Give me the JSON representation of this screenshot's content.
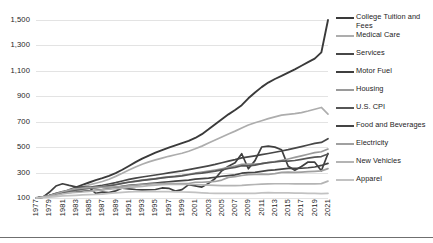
{
  "chart_data": {
    "type": "line",
    "title": "",
    "subtitle": "",
    "xlabel": "",
    "ylabel": "",
    "index_base": "Index (1977 = 100)",
    "grid": true,
    "legend_position": "right",
    "xlim": [
      1977,
      2021
    ],
    "ylim": [
      100,
      1500
    ],
    "yticks": [
      100,
      300,
      500,
      700,
      900,
      1100,
      1300,
      1500
    ],
    "ytick_labels": [
      "100",
      "300",
      "500",
      "700",
      "900",
      "1,100",
      "1,300",
      "1,500"
    ],
    "x": [
      1977,
      1978,
      1979,
      1980,
      1981,
      1982,
      1983,
      1984,
      1985,
      1986,
      1987,
      1988,
      1989,
      1990,
      1991,
      1992,
      1993,
      1994,
      1995,
      1996,
      1997,
      1998,
      1999,
      2000,
      2001,
      2002,
      2003,
      2004,
      2005,
      2006,
      2007,
      2008,
      2009,
      2010,
      2011,
      2012,
      2013,
      2014,
      2015,
      2016,
      2017,
      2018,
      2019,
      2020,
      2021
    ],
    "xtick_labels": [
      "1977",
      "1979",
      "1981",
      "1983",
      "1985",
      "1987",
      "1989",
      "1991",
      "1993",
      "1995",
      "1997",
      "1999",
      "2001",
      "2003",
      "2005",
      "2007",
      "2009",
      "2011",
      "2013",
      "2015",
      "2017",
      "2019",
      "2021"
    ],
    "series": [
      {
        "name": "College Tuition and Fees",
        "color": "#3a3a3a",
        "width": 1.9,
        "values": [
          100,
          108,
          117,
          128,
          144,
          164,
          184,
          203,
          222,
          240,
          256,
          274,
          296,
          322,
          352,
          382,
          410,
          434,
          456,
          477,
          496,
          514,
          531,
          549,
          572,
          602,
          640,
          680,
          720,
          758,
          792,
          830,
          884,
          930,
          972,
          1008,
          1036,
          1060,
          1086,
          1112,
          1140,
          1168,
          1196,
          1245,
          1525
        ]
      },
      {
        "name": "Medical Care",
        "color": "#adadad",
        "width": 1.7,
        "values": [
          100,
          108,
          118,
          130,
          145,
          162,
          177,
          190,
          203,
          216,
          230,
          248,
          270,
          294,
          320,
          344,
          366,
          384,
          400,
          414,
          428,
          440,
          452,
          468,
          487,
          508,
          532,
          556,
          580,
          604,
          626,
          650,
          674,
          692,
          708,
          724,
          738,
          752,
          758,
          764,
          772,
          784,
          798,
          812,
          760
        ]
      },
      {
        "name": "Services",
        "color": "#474747",
        "width": 1.7,
        "values": [
          100,
          108,
          118,
          131,
          146,
          158,
          167,
          175,
          184,
          192,
          200,
          210,
          221,
          234,
          246,
          256,
          265,
          273,
          281,
          289,
          297,
          305,
          313,
          323,
          333,
          343,
          353,
          364,
          377,
          390,
          402,
          416,
          424,
          432,
          441,
          450,
          460,
          470,
          480,
          492,
          504,
          517,
          530,
          537,
          566
        ]
      },
      {
        "name": "Motor Fuel",
        "color": "#3f3f3f",
        "width": 1.7,
        "values": [
          100,
          105,
          145,
          194,
          212,
          199,
          188,
          185,
          183,
          136,
          146,
          142,
          156,
          178,
          172,
          167,
          164,
          165,
          167,
          179,
          176,
          154,
          166,
          205,
          196,
          186,
          215,
          253,
          314,
          350,
          377,
          448,
          330,
          394,
          501,
          508,
          500,
          480,
          350,
          318,
          348,
          383,
          382,
          314,
          450
        ]
      },
      {
        "name": "Housing",
        "color": "#9a9a9a",
        "width": 1.7,
        "values": [
          100,
          108,
          119,
          133,
          147,
          156,
          162,
          169,
          176,
          182,
          189,
          197,
          206,
          216,
          226,
          233,
          240,
          246,
          253,
          260,
          266,
          273,
          279,
          287,
          296,
          303,
          311,
          320,
          330,
          341,
          352,
          364,
          367,
          366,
          371,
          379,
          387,
          396,
          407,
          419,
          431,
          444,
          457,
          464,
          485
        ]
      },
      {
        "name": "U.S. CPI",
        "color": "#565656",
        "width": 1.7,
        "values": [
          100,
          108,
          120,
          136,
          150,
          159,
          164,
          171,
          177,
          181,
          187,
          195,
          204,
          215,
          224,
          231,
          238,
          244,
          251,
          258,
          264,
          268,
          274,
          283,
          291,
          296,
          303,
          311,
          321,
          332,
          341,
          354,
          353,
          359,
          370,
          378,
          383,
          390,
          390,
          395,
          404,
          413,
          421,
          426,
          446
        ]
      },
      {
        "name": "Food and Beverages",
        "color": "#444444",
        "width": 1.7,
        "values": [
          100,
          108,
          119,
          131,
          140,
          145,
          148,
          153,
          157,
          161,
          166,
          173,
          181,
          191,
          199,
          203,
          208,
          213,
          218,
          223,
          228,
          232,
          236,
          241,
          248,
          252,
          256,
          263,
          271,
          276,
          282,
          295,
          300,
          301,
          310,
          317,
          321,
          327,
          333,
          333,
          334,
          338,
          344,
          356,
          372
        ]
      },
      {
        "name": "Electricity",
        "color": "#a0a0a0",
        "width": 1.7,
        "values": [
          100,
          110,
          119,
          133,
          149,
          162,
          171,
          178,
          182,
          183,
          183,
          185,
          188,
          191,
          196,
          201,
          206,
          210,
          212,
          214,
          215,
          214,
          213,
          214,
          224,
          224,
          227,
          230,
          241,
          262,
          268,
          277,
          284,
          285,
          288,
          286,
          292,
          301,
          304,
          302,
          304,
          307,
          310,
          313,
          331
        ]
      },
      {
        "name": "New Vehicles",
        "color": "#b4b4b4",
        "width": 1.7,
        "values": [
          100,
          106,
          112,
          121,
          133,
          141,
          144,
          147,
          152,
          158,
          165,
          170,
          174,
          178,
          183,
          187,
          192,
          197,
          202,
          205,
          206,
          206,
          206,
          206,
          206,
          204,
          201,
          199,
          198,
          198,
          198,
          199,
          203,
          206,
          209,
          211,
          212,
          212,
          212,
          211,
          211,
          211,
          211,
          213,
          233
        ]
      },
      {
        "name": "Apparel",
        "color": "#c2c2c2",
        "width": 1.7,
        "values": [
          100,
          103,
          106,
          111,
          116,
          118,
          121,
          124,
          127,
          128,
          131,
          136,
          140,
          145,
          148,
          149,
          150,
          150,
          150,
          150,
          150,
          148,
          147,
          146,
          144,
          141,
          138,
          137,
          136,
          137,
          136,
          136,
          137,
          136,
          140,
          142,
          141,
          141,
          140,
          139,
          138,
          137,
          136,
          135,
          137
        ]
      }
    ]
  },
  "legend": {
    "items": [
      {
        "label": "College Tuition and Fees",
        "color": "#3a3a3a"
      },
      {
        "label": "Medical Care",
        "color": "#adadad"
      },
      {
        "label": "Services",
        "color": "#474747"
      },
      {
        "label": "Motor Fuel",
        "color": "#3f3f3f"
      },
      {
        "label": "Housing",
        "color": "#9a9a9a"
      },
      {
        "label": "U.S. CPI",
        "color": "#565656"
      },
      {
        "label": "Food and Beverages",
        "color": "#444444"
      },
      {
        "label": "Electricity",
        "color": "#a0a0a0"
      },
      {
        "label": "New Vehicles",
        "color": "#b4b4b4"
      },
      {
        "label": "Apparel",
        "color": "#c2c2c2"
      }
    ]
  }
}
